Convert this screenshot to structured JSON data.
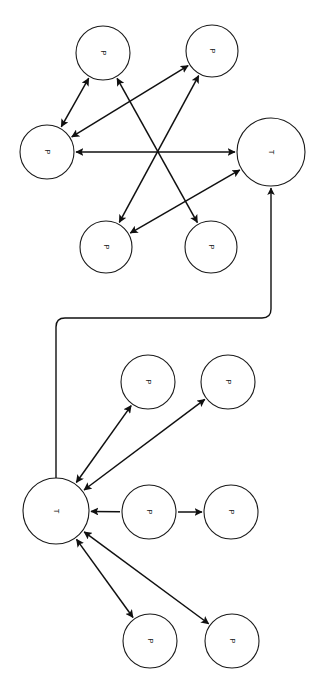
{
  "canvas": {
    "width": 318,
    "height": 681,
    "background": "#ffffff"
  },
  "style": {
    "node_fill": "#ffffff",
    "node_stroke": "#1a1a1a",
    "edge_color": "#101010",
    "label_color": "#141414",
    "label_rotation_deg": 90
  },
  "legend": {
    "place_label": "P",
    "transition_label": "T"
  },
  "clusters": [
    {
      "id": "cluster-top",
      "name": "upper-subnet",
      "nodes": [
        {
          "id": "t_p1",
          "label": "P",
          "kind": "place",
          "cx": 103,
          "cy": 53,
          "r": 27
        },
        {
          "id": "t_p2",
          "label": "P",
          "kind": "place",
          "cx": 212,
          "cy": 51,
          "r": 26
        },
        {
          "id": "t_p3",
          "label": "P",
          "kind": "place",
          "cx": 47,
          "cy": 152,
          "r": 27
        },
        {
          "id": "t_t1",
          "label": "T",
          "kind": "transition",
          "cx": 271,
          "cy": 152,
          "r": 34
        },
        {
          "id": "t_p4",
          "label": "P",
          "kind": "place",
          "cx": 106,
          "cy": 247,
          "r": 26
        },
        {
          "id": "t_p5",
          "label": "P",
          "kind": "place",
          "cx": 211,
          "cy": 247,
          "r": 26
        }
      ],
      "edges": [
        {
          "id": "e1",
          "from": "t_p1",
          "to": "t_p3",
          "arrows": "both"
        },
        {
          "id": "e2",
          "from": "t_p3",
          "to": "t_p2",
          "arrows": "both"
        },
        {
          "id": "e3",
          "from": "t_p3",
          "to": "t_t1",
          "arrows": "both"
        },
        {
          "id": "e4",
          "from": "t_p1",
          "to": "t_p5",
          "arrows": "both"
        },
        {
          "id": "e5",
          "from": "t_p2",
          "to": "t_p4",
          "arrows": "both"
        },
        {
          "id": "e6",
          "from": "t_p4",
          "to": "t_t1",
          "arrows": "both"
        }
      ]
    },
    {
      "id": "cluster-bottom",
      "name": "lower-subnet",
      "nodes": [
        {
          "id": "b_t1",
          "label": "T",
          "kind": "transition",
          "cx": 56,
          "cy": 511,
          "r": 33
        },
        {
          "id": "b_p1",
          "label": "P",
          "kind": "place",
          "cx": 148,
          "cy": 382,
          "r": 27
        },
        {
          "id": "b_p2",
          "label": "P",
          "kind": "place",
          "cx": 228,
          "cy": 382,
          "r": 27
        },
        {
          "id": "b_p3",
          "label": "P",
          "kind": "place",
          "cx": 149,
          "cy": 512,
          "r": 27
        },
        {
          "id": "b_p4",
          "label": "P",
          "kind": "place",
          "cx": 231,
          "cy": 512,
          "r": 27
        },
        {
          "id": "b_p5",
          "label": "P",
          "kind": "place",
          "cx": 150,
          "cy": 641,
          "r": 27
        },
        {
          "id": "b_p6",
          "label": "P",
          "kind": "place",
          "cx": 232,
          "cy": 641,
          "r": 27
        }
      ],
      "edges": [
        {
          "id": "f1",
          "from": "b_t1",
          "to": "b_p1",
          "arrows": "both"
        },
        {
          "id": "f2",
          "from": "b_t1",
          "to": "b_p2",
          "arrows": "both"
        },
        {
          "id": "f3",
          "from": "b_p3",
          "to": "b_t1",
          "arrows": "end"
        },
        {
          "id": "f4",
          "from": "b_p3",
          "to": "b_p4",
          "arrows": "end"
        },
        {
          "id": "f5",
          "from": "b_t1",
          "to": "b_p5",
          "arrows": "both"
        },
        {
          "id": "f6",
          "from": "b_t1",
          "to": "b_p6",
          "arrows": "both"
        }
      ]
    }
  ],
  "inter_cluster_connector": {
    "id": "connector-1",
    "name": "cluster-link",
    "from": "b_t1",
    "to": "t_t1",
    "arrows": "end",
    "waypoints": [
      {
        "x": 56,
        "y": 478
      },
      {
        "x": 56,
        "y": 318
      },
      {
        "x": 271,
        "y": 318
      },
      {
        "x": 271,
        "y": 188
      }
    ],
    "corner_radius": 9
  }
}
